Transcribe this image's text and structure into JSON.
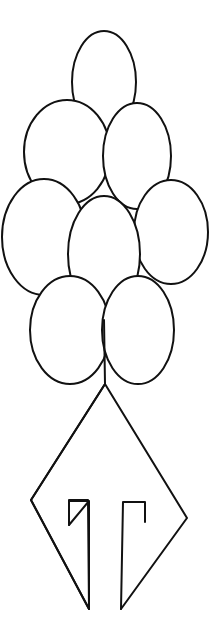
{
  "drawing": {
    "title": "Balloon bouquet line drawing",
    "stroke_color": "#111111",
    "background_color": "#ffffff",
    "elements": [
      "balloons",
      "kite-shaped base",
      "bracket marks"
    ],
    "balloon_count": 9
  }
}
